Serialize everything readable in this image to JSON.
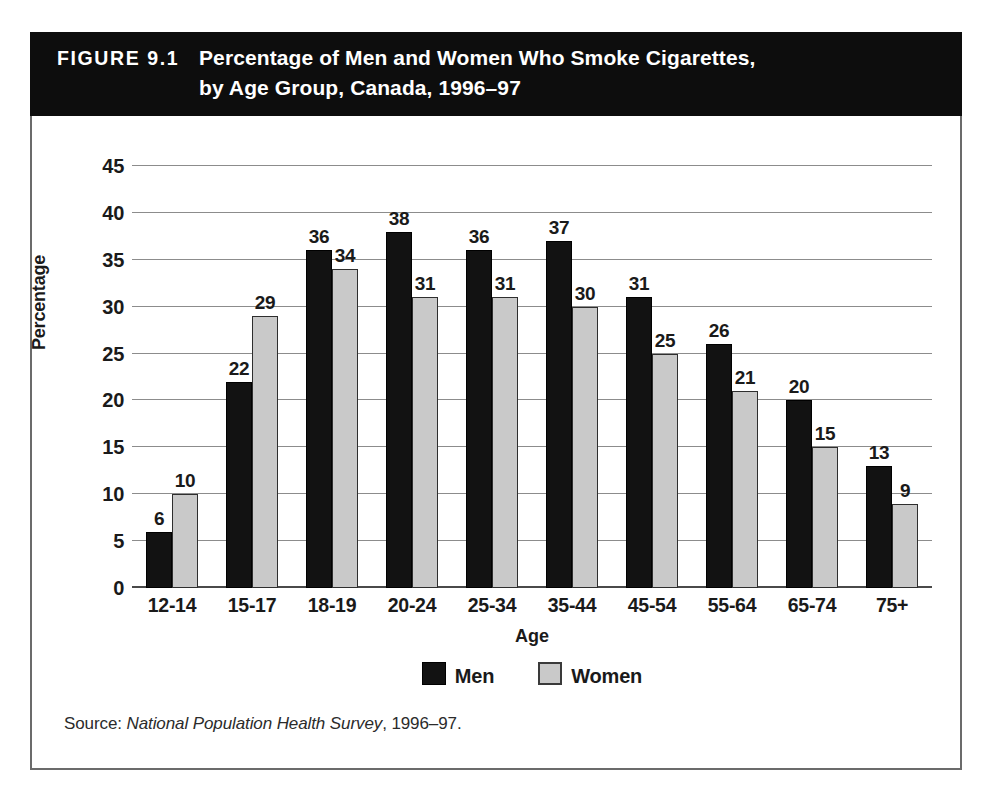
{
  "header": {
    "figure_number": "FIGURE 9.1",
    "title_line1": "Percentage of Men and Women Who Smoke Cigarettes,",
    "title_line2": "by Age Group, Canada, 1996–97",
    "background_color": "#0d0d0d",
    "text_color": "#ffffff"
  },
  "source": {
    "prefix": "Source:",
    "italic": "National Population Health Survey",
    "suffix": ", 1996–97."
  },
  "legend": {
    "entries": [
      {
        "label": "Men",
        "color": "#121212"
      },
      {
        "label": "Women",
        "color": "#c9c9c9"
      }
    ]
  },
  "chart_data": {
    "type": "bar",
    "subtitle": "",
    "xlabel": "Age",
    "ylabel": "Percentage",
    "categories": [
      "12-14",
      "15-17",
      "18-19",
      "20-24",
      "25-34",
      "35-44",
      "45-54",
      "55-64",
      "65-74",
      "75+"
    ],
    "series": [
      {
        "name": "Men",
        "color": "#121212",
        "values": [
          6,
          22,
          36,
          38,
          36,
          37,
          31,
          26,
          20,
          13
        ]
      },
      {
        "name": "Women",
        "color": "#c9c9c9",
        "values": [
          10,
          29,
          34,
          31,
          31,
          30,
          25,
          21,
          15,
          9
        ]
      }
    ],
    "ylim": [
      0,
      45
    ],
    "yticks": [
      0,
      5,
      10,
      15,
      20,
      25,
      30,
      35,
      40,
      45
    ],
    "ytick_labels": [
      "0",
      "5",
      "10",
      "15",
      "20",
      "25",
      "30",
      "35",
      "40",
      "45"
    ],
    "grid": true,
    "grid_axis": "y",
    "legend_position": "bottom",
    "data_labels": true,
    "units": "percent"
  }
}
